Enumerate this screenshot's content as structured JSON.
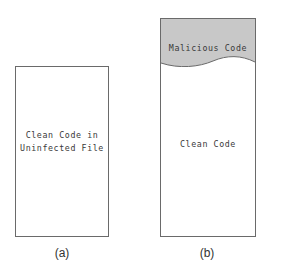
{
  "diagram": {
    "panel_a": {
      "label_line1": "Clean Code in",
      "label_line2": "Uninfected File",
      "caption": "(a)"
    },
    "panel_b": {
      "header_label": "Malicious Code",
      "body_label": "Clean Code",
      "caption": "(b)"
    },
    "colors": {
      "malicious_fill": "#c8c8c8",
      "border": "#6a6a6a"
    }
  }
}
